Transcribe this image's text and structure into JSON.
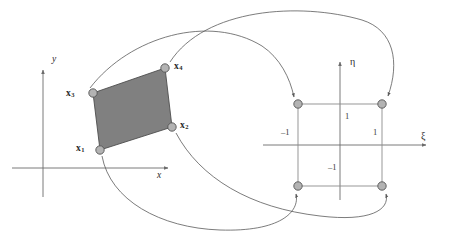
{
  "figure": {
    "colors": {
      "element_fill": "#808080",
      "element_stroke": "#4d4d4d",
      "node_fill": "#b3b3b3",
      "node_stroke": "#555555",
      "axis": "#6b6b6b",
      "map_curve": "#5a5a5a",
      "square_edge": "#8c8c8c",
      "text": "#2b2b2b",
      "background": "#ffffff"
    }
  },
  "physical_domain": {
    "name": "physical-element",
    "axes": {
      "x_label": "x",
      "y_label": "y"
    },
    "nodes": [
      {
        "id": "x1",
        "label": "x",
        "subscript": "1",
        "cx": 100,
        "cy": 150,
        "label_x": 76,
        "label_y": 144
      },
      {
        "id": "x2",
        "label": "x",
        "subscript": "2",
        "cx": 172,
        "cy": 127,
        "label_x": 180,
        "label_y": 121
      },
      {
        "id": "x3",
        "label": "x",
        "subscript": "3",
        "cx": 93,
        "cy": 93,
        "label_x": 66,
        "label_y": 90
      },
      {
        "id": "x4",
        "label": "x",
        "subscript": "4",
        "cx": 165,
        "cy": 68,
        "label_x": 174,
        "label_y": 62
      }
    ]
  },
  "reference_domain": {
    "name": "reference-square",
    "axes": {
      "xi_label": "ξ",
      "eta_label": "η"
    },
    "ticks": [
      {
        "id": "xi-neg-one",
        "text": "–1",
        "x": 281,
        "y": 134
      },
      {
        "id": "xi-pos-one",
        "text": "1",
        "x": 373,
        "y": 134
      },
      {
        "id": "eta-pos-one",
        "text": "1",
        "x": 345,
        "y": 117
      },
      {
        "id": "eta-neg-one",
        "text": "–1",
        "x": 330,
        "y": 168
      }
    ],
    "nodes": [
      {
        "id": "n3",
        "cx": 298,
        "cy": 104
      },
      {
        "id": "n4",
        "cx": 382,
        "cy": 104
      },
      {
        "id": "n1",
        "cx": 298,
        "cy": 186
      },
      {
        "id": "n2",
        "cx": 382,
        "cy": 186
      }
    ]
  },
  "mapping_arrows": [
    {
      "id": "arrow-x4-to-n4",
      "from_node": "x4",
      "to_node": "n4"
    },
    {
      "id": "arrow-x3-to-n3",
      "from_node": "x3",
      "to_node": "n3"
    },
    {
      "id": "arrow-x1-to-n1",
      "from_node": "x1",
      "to_node": "n1"
    },
    {
      "id": "arrow-x2-to-n2",
      "from_node": "x2",
      "to_node": "n2"
    }
  ]
}
